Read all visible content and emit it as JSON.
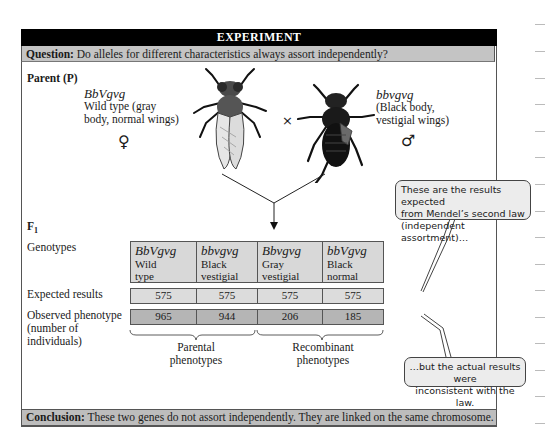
{
  "header": {
    "title": "EXPERIMENT"
  },
  "question": {
    "label": "Question:",
    "text": " Do alleles for different characteristics always assort independently?"
  },
  "parent": {
    "label": "Parent (P)",
    "female": {
      "genotype": "BbVgvg",
      "line1": "Wild type (gray",
      "line2": "body, normal wings)",
      "symbol": "♀",
      "icon": "fly-gray-normal-wings"
    },
    "cross_symbol": "×",
    "male": {
      "genotype": "bbvgvg",
      "line1": "(Black body,",
      "line2": "vestigial wings)",
      "symbol": "♂",
      "icon": "fly-black-vestigial-wings"
    }
  },
  "f1": {
    "label": "F",
    "label_sub": "1",
    "row_labels": {
      "genotypes": "Genotypes",
      "expected": "Expected results",
      "observed_line1": "Observed phenotype",
      "observed_line2": "(number of",
      "observed_line3": "individuals)"
    },
    "columns": [
      {
        "genotype": "BbVgvg",
        "desc1": "Wild",
        "desc2": "type",
        "expected": "575",
        "observed": "965"
      },
      {
        "genotype": "bbvgvg",
        "desc1": "Black",
        "desc2": "vestigial",
        "expected": "575",
        "observed": "944"
      },
      {
        "genotype": "Bbvgvg",
        "desc1": "Gray",
        "desc2": "vestigial",
        "expected": "575",
        "observed": "206"
      },
      {
        "genotype": "bbVgvg",
        "desc1": "Black",
        "desc2": "normal",
        "expected": "575",
        "observed": "185"
      }
    ],
    "brace_labels": {
      "parental_line1": "Parental",
      "parental_line2": "phenotypes",
      "recombinant_line1": "Recombinant",
      "recombinant_line2": "phenotypes"
    }
  },
  "callouts": {
    "expected": {
      "line1": "These are the results expected",
      "line2": "from Mendel’s second law",
      "line3": "(independent assortment)…"
    },
    "actual": {
      "line1": "…but the actual results were",
      "line2": "inconsistent with the law."
    }
  },
  "conclusion": {
    "label": "Conclusion:",
    "text": " These two genes do not assort independently. They are linked on the same chromosome."
  },
  "colors": {
    "header_bg": "#000000",
    "band_bg": "#c4c4c4",
    "expected_bg": "#dcdcdc",
    "observed_bg": "#b5b5b5",
    "callout_bg": "#ececec"
  }
}
